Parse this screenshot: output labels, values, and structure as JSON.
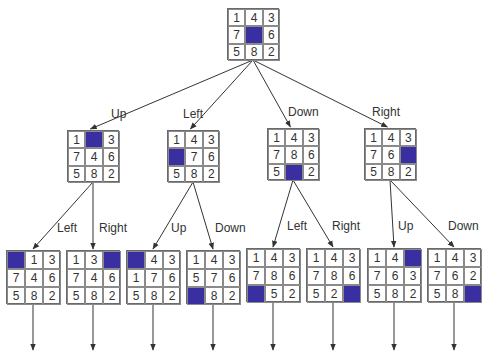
{
  "colors": {
    "blank_tile": "#3a2fa0",
    "line": "#333333",
    "grid": "#8a8a8a",
    "text": "#333333"
  },
  "root": {
    "tiles": [
      "1",
      "4",
      "3",
      "7",
      "",
      "6",
      "5",
      "8",
      "2"
    ],
    "x": 227,
    "y": 8,
    "size": 52
  },
  "level1": [
    {
      "move": "Up",
      "tiles": [
        "1",
        "",
        "3",
        "7",
        "4",
        "6",
        "5",
        "8",
        "2"
      ],
      "x": 67,
      "y": 130,
      "size": 52,
      "label_x": 111,
      "label_y": 107
    },
    {
      "move": "Left",
      "tiles": [
        "1",
        "4",
        "3",
        "",
        "7",
        "6",
        "5",
        "8",
        "2"
      ],
      "x": 167,
      "y": 130,
      "size": 52,
      "label_x": 183,
      "label_y": 107
    },
    {
      "move": "Down",
      "tiles": [
        "1",
        "4",
        "3",
        "7",
        "8",
        "6",
        "5",
        "",
        "2"
      ],
      "x": 267,
      "y": 128,
      "size": 52,
      "label_x": 288,
      "label_y": 105
    },
    {
      "move": "Right",
      "tiles": [
        "1",
        "4",
        "3",
        "7",
        "6",
        "",
        "5",
        "8",
        "2"
      ],
      "x": 364,
      "y": 128,
      "size": 52,
      "label_x": 372,
      "label_y": 105
    }
  ],
  "level2": [
    {
      "move": "Left",
      "parent": 0,
      "tiles": [
        "",
        "1",
        "3",
        "7",
        "4",
        "6",
        "5",
        "8",
        "2"
      ],
      "x": 6,
      "y": 250,
      "size": 54,
      "label_x": 57,
      "label_y": 221
    },
    {
      "move": "Right",
      "parent": 0,
      "tiles": [
        "1",
        "3",
        "",
        "7",
        "4",
        "6",
        "5",
        "8",
        "2"
      ],
      "x": 66,
      "y": 250,
      "size": 54,
      "label_x": 99,
      "label_y": 221
    },
    {
      "move": "Up",
      "parent": 1,
      "tiles": [
        "",
        "4",
        "3",
        "1",
        "7",
        "6",
        "5",
        "8",
        "2"
      ],
      "x": 126,
      "y": 250,
      "size": 54,
      "label_x": 171,
      "label_y": 221
    },
    {
      "move": "Down",
      "parent": 1,
      "tiles": [
        "1",
        "4",
        "3",
        "5",
        "7",
        "6",
        "",
        "8",
        "2"
      ],
      "x": 186,
      "y": 250,
      "size": 54,
      "label_x": 215,
      "label_y": 221
    },
    {
      "move": "Left",
      "parent": 2,
      "tiles": [
        "1",
        "4",
        "3",
        "7",
        "8",
        "6",
        "",
        "5",
        "2"
      ],
      "x": 246,
      "y": 248,
      "size": 54,
      "label_x": 287,
      "label_y": 219
    },
    {
      "move": "Right",
      "parent": 2,
      "tiles": [
        "1",
        "4",
        "3",
        "7",
        "8",
        "6",
        "5",
        "2",
        ""
      ],
      "x": 306,
      "y": 248,
      "size": 54,
      "label_x": 332,
      "label_y": 219
    },
    {
      "move": "Up",
      "parent": 3,
      "tiles": [
        "1",
        "4",
        "",
        "7",
        "6",
        "3",
        "5",
        "8",
        "2"
      ],
      "x": 367,
      "y": 248,
      "size": 54,
      "label_x": 398,
      "label_y": 219
    },
    {
      "move": "Down",
      "parent": 3,
      "tiles": [
        "1",
        "4",
        "3",
        "7",
        "6",
        "2",
        "5",
        "8",
        ""
      ],
      "x": 427,
      "y": 248,
      "size": 54,
      "label_x": 448,
      "label_y": 219
    }
  ]
}
